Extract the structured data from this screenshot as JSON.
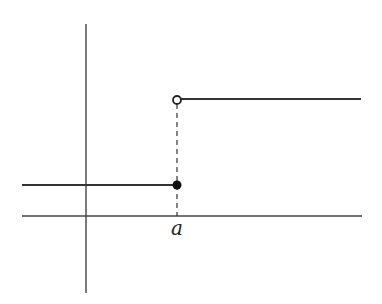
{
  "diagram": {
    "type": "step-function",
    "axes": {
      "x_axis": {
        "y": 216,
        "x_start": 22,
        "x_end": 362
      },
      "y_axis": {
        "x": 86,
        "y_start": 24,
        "y_end": 293
      }
    },
    "segments": [
      {
        "name": "lower-segment",
        "x1": 22,
        "y1": 185,
        "x2": 177,
        "y2": 185
      },
      {
        "name": "upper-segment",
        "x1": 181,
        "y1": 99,
        "x2": 361,
        "y2": 99
      }
    ],
    "jump": {
      "x": 177,
      "closed_point": {
        "x": 177,
        "y": 185
      },
      "open_point": {
        "x": 177,
        "y": 99
      },
      "dashed_guide": {
        "y_top": 104,
        "y_bottom": 216
      }
    },
    "labels": {
      "jump_point": "a"
    },
    "colors": {
      "stroke": "#333333",
      "background": "#ffffff"
    }
  }
}
